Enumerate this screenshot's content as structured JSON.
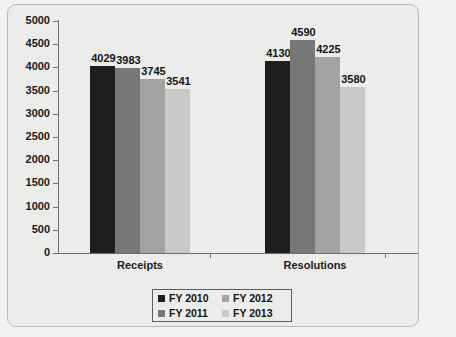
{
  "chart_data": {
    "type": "bar",
    "title": "",
    "xlabel": "",
    "ylabel": "",
    "categories": [
      "Receipts",
      "Resolutions"
    ],
    "series": [
      {
        "name": "FY 2010",
        "color": "#1e1e1e",
        "values": [
          4029,
          4130
        ]
      },
      {
        "name": "FY 2011",
        "color": "#777777",
        "values": [
          3983,
          4590
        ]
      },
      {
        "name": "FY 2012",
        "color": "#a3a3a3",
        "values": [
          3745,
          4225
        ]
      },
      {
        "name": "FY 2013",
        "color": "#c9c9c7",
        "values": [
          3541,
          3580
        ]
      }
    ],
    "ylim": [
      0,
      5000
    ],
    "ytick_step": 500,
    "ytick_labels": [
      "5000",
      "4500",
      "4000",
      "3500",
      "3000",
      "2500",
      "2000",
      "1500",
      "1000",
      "500",
      "0"
    ],
    "grid": false,
    "legend_position": "bottom-center",
    "legend_order": [
      "FY 2010",
      "FY 2012",
      "FY 2011",
      "FY 2013"
    ],
    "data_labels": {
      "Receipts": [
        "4029",
        "3983",
        "3745",
        "3541"
      ],
      "Resolutions": [
        "4130",
        "4590",
        "4225",
        "3580"
      ]
    }
  }
}
